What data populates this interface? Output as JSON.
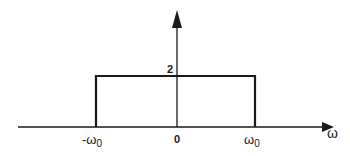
{
  "figure": {
    "type": "rectangular-spectrum",
    "height_label": "2",
    "x_axis_label": "ω",
    "ticks": [
      {
        "main": "-ω",
        "sub": "0"
      },
      {
        "main": "0",
        "sub": ""
      },
      {
        "main": "ω",
        "sub": "0"
      }
    ],
    "colors": {
      "line": "#1a1a1a",
      "background": "#ffffff"
    }
  }
}
